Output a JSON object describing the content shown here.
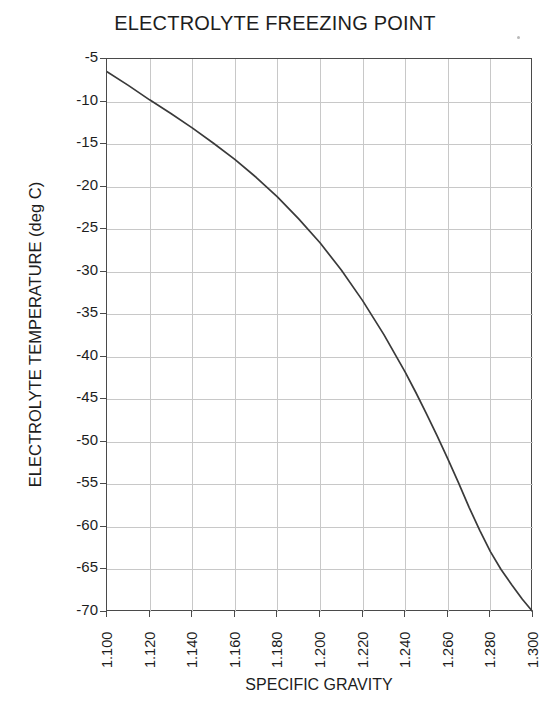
{
  "chart_data": {
    "type": "line",
    "title": "ELECTROLYTE FREEZING POINT",
    "xlabel": "SPECIFIC GRAVITY",
    "ylabel": "ELECTROLYTE TEMPERATURE (deg C)",
    "xlim": [
      1.1,
      1.3
    ],
    "ylim": [
      -70,
      -5
    ],
    "grid": true,
    "legend": null,
    "x_ticks": [
      "1.100",
      "1.120",
      "1.140",
      "1.160",
      "1.180",
      "1.200",
      "1.220",
      "1.240",
      "1.260",
      "1.280",
      "1.300"
    ],
    "x_tick_values": [
      1.1,
      1.12,
      1.14,
      1.16,
      1.18,
      1.2,
      1.22,
      1.24,
      1.26,
      1.28,
      1.3
    ],
    "y_ticks": [
      "-5",
      "-10",
      "-15",
      "-20",
      "-25",
      "-30",
      "-35",
      "-40",
      "-45",
      "-50",
      "-55",
      "-60",
      "-65",
      "-70"
    ],
    "y_tick_values": [
      -5,
      -10,
      -15,
      -20,
      -25,
      -30,
      -35,
      -40,
      -45,
      -50,
      -55,
      -60,
      -65,
      -70
    ],
    "series": [
      {
        "name": "Freezing point",
        "color": "#3a3a3a",
        "x": [
          1.1,
          1.11,
          1.12,
          1.13,
          1.14,
          1.15,
          1.16,
          1.17,
          1.18,
          1.19,
          1.2,
          1.21,
          1.22,
          1.23,
          1.24,
          1.245,
          1.25,
          1.255,
          1.26,
          1.265,
          1.27,
          1.275,
          1.28,
          1.285,
          1.29,
          1.295,
          1.3
        ],
        "values": [
          -6.5,
          -8.1,
          -9.8,
          -11.4,
          -13.1,
          -14.9,
          -16.8,
          -18.9,
          -21.2,
          -23.8,
          -26.6,
          -29.8,
          -33.4,
          -37.4,
          -41.8,
          -44.2,
          -46.7,
          -49.3,
          -52.0,
          -54.8,
          -57.7,
          -60.4,
          -62.9,
          -65.0,
          -66.8,
          -68.5,
          -70.0
        ]
      }
    ]
  },
  "axes": {
    "y_axis_name": "y-axis",
    "x_axis_name": "x-axis"
  }
}
